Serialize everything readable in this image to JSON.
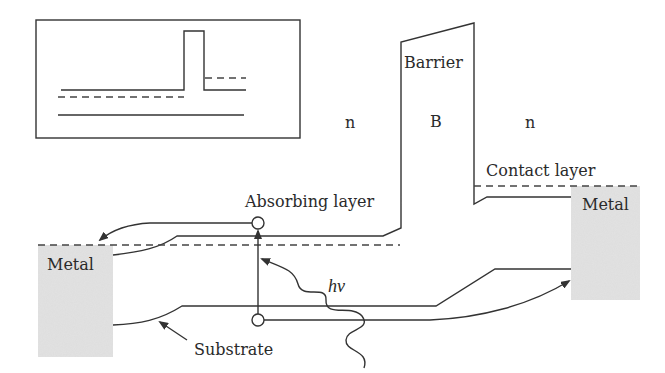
{
  "figure": {
    "colors": {
      "line": "#333333",
      "metal_fill": "#dcdcdc",
      "background": "#ffffff"
    }
  },
  "labels": {
    "barrier": "Barrier",
    "barrier_region": "B",
    "n_left": "n",
    "n_right": "n",
    "contact_layer": "Contact layer",
    "absorbing_layer": "Absorbing layer",
    "metal_left": "Metal",
    "metal_right": "Metal",
    "substrate": "Substrate",
    "photon": "hν"
  },
  "inset": {
    "description": "Flat-band schematic of nBn structure"
  }
}
